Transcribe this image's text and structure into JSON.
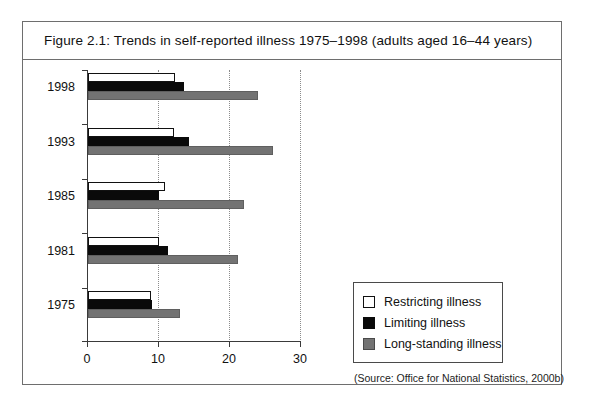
{
  "figure": {
    "title": "Figure 2.1:  Trends in self-reported illness 1975–1998 (adults aged 16–44 years)",
    "source_note": "(Source: Office for National Statistics, 2000b)"
  },
  "legend": {
    "items": [
      {
        "label": "Restricting illness",
        "swatch": "white-square-outlined",
        "color": "#ffffff"
      },
      {
        "label": "Limiting illness",
        "swatch": "black-square",
        "color": "#0a0a0a"
      },
      {
        "label": "Long-standing illness",
        "swatch": "grey-square",
        "color": "#737373"
      }
    ]
  },
  "chart_data": {
    "type": "bar",
    "orientation": "horizontal",
    "title": "Figure 2.1:  Trends in self-reported illness 1975–1998 (adults aged 16–44 years)",
    "categories": [
      "1998",
      "1993",
      "1985",
      "1981",
      "1975"
    ],
    "series": [
      {
        "name": "Restricting illness",
        "color": "#ffffff",
        "values": [
          12.3,
          12.1,
          10.9,
          10.0,
          8.9
        ]
      },
      {
        "name": "Limiting illness",
        "color": "#0a0a0a",
        "values": [
          13.5,
          14.2,
          10.0,
          11.3,
          9.0
        ]
      },
      {
        "name": "Long-standing illness",
        "color": "#737373",
        "values": [
          24.0,
          26.0,
          22.0,
          21.1,
          13.0
        ]
      }
    ],
    "xlabel": "",
    "ylabel": "",
    "xlim": [
      0,
      30
    ],
    "xticks": [
      0,
      10,
      20,
      30
    ],
    "xtick_labels": [
      "0",
      "10",
      "20",
      "30"
    ],
    "gridlines": [
      10,
      20,
      30
    ],
    "grid": true,
    "grid_style": "dotted-vertical",
    "legend_position": "right-lower"
  }
}
